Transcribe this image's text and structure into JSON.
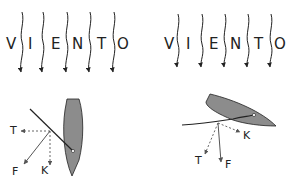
{
  "panels": [
    {
      "id": "left",
      "wind_letters": [
        "V",
        "I",
        "E",
        "N",
        "T",
        "O"
      ],
      "force_labels": {
        "T": "T",
        "F": "F",
        "K": "K"
      }
    },
    {
      "id": "right",
      "wind_letters": [
        "V",
        "I",
        "E",
        "N",
        "T",
        "O"
      ],
      "force_labels": {
        "T": "T",
        "F": "F",
        "K": "K"
      }
    }
  ],
  "colors": {
    "hull": "#8c8c8c",
    "line": "#222222",
    "force_arrow": "#555555"
  }
}
